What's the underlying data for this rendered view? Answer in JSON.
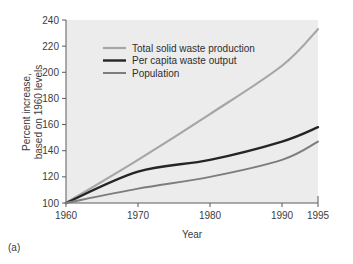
{
  "figure": {
    "caption": "(a)"
  },
  "chart_data": {
    "type": "line",
    "title": "",
    "xlabel": "Year",
    "ylabel": "Percent increase,\nbased on 1960 levels",
    "ylabel_line1": "Percent increase,",
    "ylabel_line2": "based on 1960 levels",
    "x": [
      1960,
      1970,
      1980,
      1990,
      1995
    ],
    "xlim": [
      1960,
      1995
    ],
    "ylim": [
      100,
      240
    ],
    "xticks": [
      1960,
      1970,
      1980,
      1990,
      1995
    ],
    "xtick_labels": [
      "1960",
      "1970",
      "1980",
      "1990",
      "1995"
    ],
    "yticks": [
      100,
      120,
      140,
      160,
      180,
      200,
      220,
      240
    ],
    "ytick_labels": [
      "100",
      "120",
      "140",
      "160",
      "180",
      "200",
      "220",
      "240"
    ],
    "grid": false,
    "legend_position": "upper-left-inside",
    "plot_background": "#ececec",
    "series": [
      {
        "name": "Total solid waste production",
        "color": "#a6a6a6",
        "width": 2.2,
        "values": [
          100,
          133,
          168,
          205,
          233
        ]
      },
      {
        "name": "Per capita waste output",
        "color": "#252525",
        "width": 2.4,
        "values": [
          100,
          124,
          133,
          147,
          158
        ]
      },
      {
        "name": "Population",
        "color": "#7d7d7d",
        "width": 2.0,
        "values": [
          100,
          111,
          120,
          133,
          147
        ]
      }
    ]
  }
}
